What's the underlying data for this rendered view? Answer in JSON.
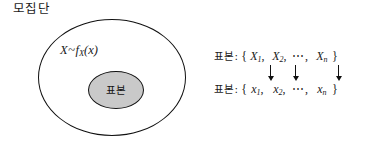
{
  "diagram": {
    "population": {
      "label": "모집단",
      "distribution": {
        "variable": "X",
        "tilde": "~",
        "density": "f",
        "density_subscript": "X",
        "argument": "(x)"
      }
    },
    "sample": {
      "label": "표본",
      "fill_color": "#c9c9c9",
      "stroke_color": "#111111"
    }
  },
  "notation": {
    "random_variable_row": {
      "label": "표본:",
      "open_brace": "{",
      "terms": [
        {
          "symbol": "X",
          "subscript": "1",
          "separator": ","
        },
        {
          "symbol": "X",
          "subscript": "2",
          "separator": ","
        }
      ],
      "ellipsis": "⋯",
      "ellipsis_separator": ",",
      "last_term": {
        "symbol": "X",
        "subscript": "n"
      },
      "close_brace": "}"
    },
    "realization_row": {
      "label": "표본:",
      "open_brace": "{",
      "terms": [
        {
          "symbol": "x",
          "subscript": "1",
          "separator": ","
        },
        {
          "symbol": "x",
          "subscript": "2",
          "separator": ","
        }
      ],
      "ellipsis": "⋯",
      "ellipsis_separator": ",",
      "last_term": {
        "symbol": "x",
        "subscript": "n"
      },
      "close_brace": "}"
    },
    "arrows": {
      "count": 3,
      "direction": "down",
      "glyph": "↓"
    }
  }
}
